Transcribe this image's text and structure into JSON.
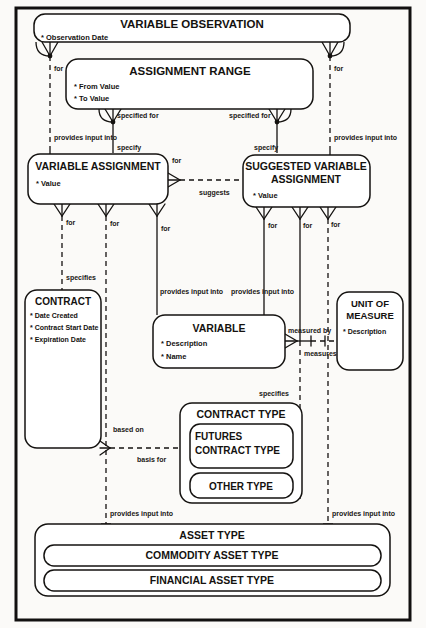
{
  "diagram": {
    "type": "entity-relationship-diagram",
    "entities": {
      "variable_observation": {
        "name": "VARIABLE OBSERVATION",
        "attributes": [
          "* Observation Date"
        ]
      },
      "assignment_range": {
        "name": "ASSIGNMENT RANGE",
        "attributes": [
          "* From Value",
          "* To Value"
        ]
      },
      "variable_assignment": {
        "name": "VARIABLE ASSIGNMENT",
        "attributes": [
          "* Value"
        ]
      },
      "suggested_variable_assignment": {
        "name_line1": "SUGGESTED VARIABLE",
        "name_line2": "ASSIGNMENT",
        "attributes": [
          "* Value"
        ]
      },
      "contract": {
        "name": "CONTRACT",
        "attributes": [
          "* Date Created",
          "* Contract Start Date",
          "* Expiration Date"
        ]
      },
      "variable": {
        "name": "VARIABLE",
        "attributes": [
          "* Description",
          "* Name"
        ]
      },
      "unit_of_measure": {
        "name_line1": "UNIT OF",
        "name_line2": "MEASURE",
        "attributes": [
          "* Description"
        ]
      },
      "contract_type": {
        "name": "CONTRACT TYPE",
        "subtypes": {
          "futures_contract_type_line1": "FUTURES",
          "futures_contract_type_line2": "CONTRACT TYPE",
          "other_type": "OTHER TYPE"
        }
      },
      "asset_type": {
        "name": "ASSET TYPE",
        "subtypes": {
          "commodity_asset_type": "COMMODITY ASSET TYPE",
          "financial_asset_type": "FINANCIAL ASSET TYPE"
        }
      }
    },
    "relationships": {
      "for_left_top": "for",
      "for_right_top": "for",
      "specified_for_left": "specified for",
      "specified_for_right": "specified for",
      "provides_input_into_far_left": "provides input into",
      "provides_input_into_far_right": "provides input into",
      "specify_left": "specify",
      "specify_right": "specify",
      "suggests": "suggests",
      "for_va_right": "for",
      "for_va_1": "for",
      "for_va_2": "for",
      "for_va_3": "for",
      "for_sva_1": "for",
      "for_sva_2": "for",
      "for_sva_3": "for",
      "specifies_contract": "specifies",
      "provides_input_into_variable_left": "provides input into",
      "provides_input_into_variable_right": "provides input into",
      "measured_by": "measured by",
      "measures": "measures",
      "specifies_contract_type": "specifies",
      "based_on": "based on",
      "basis_for": "basis for",
      "provides_input_into_asset_left": "provides input into",
      "provides_input_into_asset_right": "provides input into"
    },
    "colors": {
      "ink": "#141210",
      "paper": "#fbfaf8",
      "box_fill": "#ffffff"
    }
  }
}
